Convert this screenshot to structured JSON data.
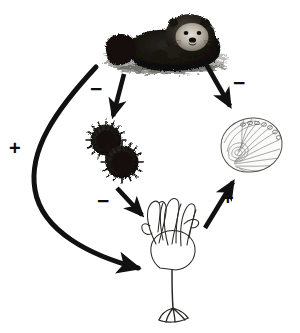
{
  "figure": {
    "type": "trophic-cascade-diagram",
    "background_color": "#ffffff",
    "ink_color": "#111111",
    "width": 300,
    "height": 333
  },
  "nodes": [
    {
      "id": "sea-otter",
      "label": "sea otter",
      "icon": "sea-otter-icon",
      "style": "dark halftone engraving, otter floating on back in water",
      "x": 165,
      "y": 40
    },
    {
      "id": "sea-urchins",
      "label": "sea urchins",
      "icon": "sea-urchin-icon",
      "style": "two dark spiny urchins",
      "x": 112,
      "y": 152
    },
    {
      "id": "abalone",
      "label": "abalone",
      "icon": "abalone-shell-icon",
      "style": "light line-drawn shell with radiating growth lines and row of pores",
      "x": 250,
      "y": 145
    },
    {
      "id": "kelp",
      "label": "kelp",
      "icon": "kelp-icon",
      "style": "line-drawn kelp with blades, stipe and holdfast",
      "x": 175,
      "y": 265
    }
  ],
  "edges": [
    {
      "id": "otter-to-urchins",
      "from": "sea-otter",
      "to": "sea-urchins",
      "sign": "−",
      "sign_name": "minus",
      "shape": "straight",
      "label_x": 94,
      "label_y": 86
    },
    {
      "id": "otter-to-abalone",
      "from": "sea-otter",
      "to": "abalone",
      "sign": "−",
      "sign_name": "minus",
      "shape": "straight",
      "label_x": 236,
      "label_y": 80
    },
    {
      "id": "otter-to-kelp",
      "from": "sea-otter",
      "to": "kelp",
      "sign": "+",
      "sign_name": "plus",
      "shape": "long-curved",
      "label_x": 12,
      "label_y": 146
    },
    {
      "id": "urchins-to-kelp",
      "from": "sea-urchins",
      "to": "kelp",
      "sign": "−",
      "sign_name": "minus",
      "shape": "straight",
      "label_x": 101,
      "label_y": 198
    },
    {
      "id": "kelp-to-abalone",
      "from": "kelp",
      "to": "abalone",
      "sign": "+",
      "sign_name": "plus",
      "shape": "straight",
      "label_x": 225,
      "label_y": 196
    }
  ]
}
